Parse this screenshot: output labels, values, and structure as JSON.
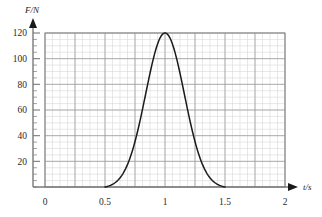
{
  "chart_data": {
    "type": "line",
    "title": "",
    "subtitle": "",
    "xlabel": "t/s",
    "ylabel": "F/N",
    "xlim": [
      0,
      2
    ],
    "ylim": [
      0,
      120
    ],
    "grid": true,
    "legend": null,
    "x_ticks": [
      "0",
      "0.5",
      "1",
      "1.5",
      "2"
    ],
    "x_tick_values": [
      0,
      0.5,
      1,
      1.5,
      2
    ],
    "y_ticks": [
      "20",
      "40",
      "60",
      "80",
      "100",
      "120"
    ],
    "y_tick_values": [
      20,
      40,
      60,
      80,
      100,
      120
    ],
    "x_minor_step": 0.0625,
    "y_minor_step": 5,
    "series": [
      {
        "name": "Force pulse",
        "color": "#1a1a1a",
        "x": [
          0.5,
          0.525,
          0.55,
          0.575,
          0.6,
          0.625,
          0.65,
          0.675,
          0.7,
          0.725,
          0.75,
          0.775,
          0.8,
          0.825,
          0.85,
          0.875,
          0.9,
          0.925,
          0.95,
          0.975,
          1.0,
          1.025,
          1.05,
          1.075,
          1.1,
          1.125,
          1.15,
          1.175,
          1.2,
          1.225,
          1.25,
          1.275,
          1.3,
          1.325,
          1.35,
          1.375,
          1.4,
          1.425,
          1.45,
          1.475,
          1.5
        ],
        "y": [
          0.0,
          0.5,
          1.1,
          2.0,
          3.2,
          4.8,
          6.9,
          9.5,
          12.7,
          16.6,
          21.2,
          26.6,
          32.7,
          39.5,
          47.0,
          55.0,
          63.3,
          71.7,
          79.9,
          87.6,
          120.0,
          87.6,
          79.9,
          71.7,
          63.3,
          55.0,
          47.0,
          39.5,
          32.7,
          26.6,
          21.2,
          16.6,
          12.7,
          9.5,
          6.9,
          4.8,
          3.2,
          2.0,
          1.1,
          0.5,
          0.0
        ],
        "peak_x": 1.0,
        "peak_y": 120
      }
    ],
    "annotations": [],
    "axis_arrows": {
      "x_axis": true,
      "y_axis": true
    }
  },
  "geometry": {
    "plot_left": 45,
    "plot_right": 285,
    "plot_top": 33,
    "plot_bottom": 187,
    "y_axis_x": 33,
    "y_arrow_tip_y": 19,
    "x_arrow_tip_x": 297
  },
  "colors": {
    "curve": "#1a1a1a",
    "axis": "#7a7a7a",
    "grid_major": "#9a9a9a",
    "grid_minor": "#d8d8d8",
    "plot_border": "#8a8a8a",
    "background": "#ffffff",
    "text": "#2a2a2a"
  }
}
